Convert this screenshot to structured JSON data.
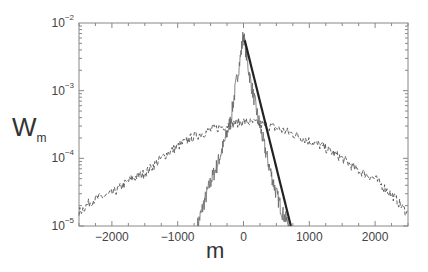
{
  "chart_data": {
    "type": "line",
    "title": "",
    "xlabel": "m",
    "ylabel": "W",
    "ylabel_subscript": "m",
    "xlim": [
      -2500,
      2500
    ],
    "ylim": [
      1e-05,
      0.01
    ],
    "yscale": "log",
    "grid": false,
    "legend": null,
    "x_ticks": [
      -2000,
      -1000,
      0,
      1000,
      2000
    ],
    "x_tick_labels": [
      "−2000",
      "−1000",
      "0",
      "1000",
      "2000"
    ],
    "y_tick_labels": [
      {
        "base": "10",
        "exp": "−2"
      },
      {
        "base": "10",
        "exp": "−3"
      },
      {
        "base": "10",
        "exp": "−4"
      },
      {
        "base": "10",
        "exp": "−5"
      }
    ],
    "series": [
      {
        "name": "narrow distribution (thin solid)",
        "style": "thin-solid",
        "x": [
          -700,
          -600,
          -500,
          -400,
          -300,
          -200,
          -100,
          -50,
          0,
          50,
          100,
          200,
          300,
          400,
          500,
          600,
          700
        ],
        "y": [
          1e-05,
          2.2e-05,
          4.5e-05,
          8e-05,
          0.00016,
          0.00035,
          0.0015,
          0.003,
          0.007,
          0.003,
          0.0015,
          0.0005,
          0.00018,
          7e-05,
          3e-05,
          1.5e-05,
          1e-05
        ]
      },
      {
        "name": "broad distribution (dashed)",
        "style": "dashed",
        "x": [
          -2500,
          -2300,
          -2000,
          -1700,
          -1500,
          -1200,
          -1000,
          -800,
          -500,
          -200,
          0,
          200,
          500,
          800,
          1000,
          1200,
          1500,
          1700,
          2000,
          2300,
          2500
        ],
        "y": [
          1.6e-05,
          2.4e-05,
          3e-05,
          5e-05,
          6e-05,
          0.00011,
          0.00015,
          0.0002,
          0.00026,
          0.00032,
          0.00035,
          0.00033,
          0.00028,
          0.00022,
          0.00018,
          0.00015,
          0.0001,
          7e-05,
          5e-05,
          2.6e-05,
          1.5e-05
        ]
      },
      {
        "name": "exponential fit (thick solid)",
        "style": "thick-solid",
        "x": [
          20,
          720
        ],
        "y": [
          0.0055,
          1e-05
        ]
      }
    ]
  },
  "axes": {
    "xlabel": "m",
    "ylabel_main": "W",
    "ylabel_sub": "m"
  }
}
